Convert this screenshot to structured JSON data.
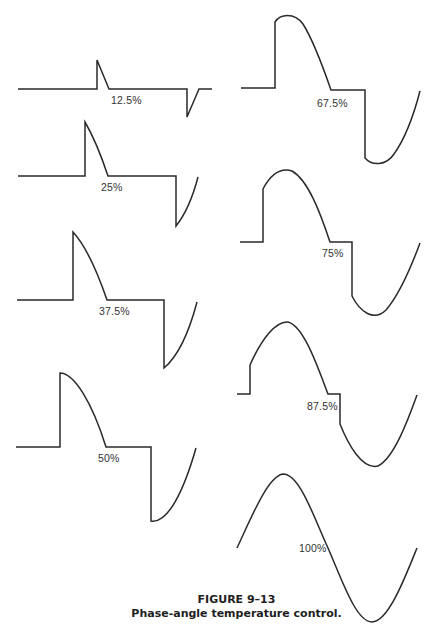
{
  "caption": {
    "figure_number": "FIGURE 9–13",
    "title": "Phase-angle temperature control."
  },
  "colors": {
    "stroke": "#2a2a2a",
    "background": "#ffffff",
    "text": "#333333"
  },
  "waveforms": [
    {
      "label": "12.5%",
      "label_pos": [
        111,
        94
      ],
      "path": "M18,89 L97,89 L97,60 L109,89 L187,89 L187,117 L199,89 L212,89"
    },
    {
      "label": "25%",
      "label_pos": [
        101,
        181
      ],
      "path": "M18,176 L85,176 L85,122 C92,134 100,152 108,176 L176,176 L176,226 C184,216 192,200 198,177"
    },
    {
      "label": "37.5%",
      "label_pos": [
        99,
        305
      ],
      "path": "M17,300 L73,300 L73,232 C84,244 96,268 107,300 L164,300 L164,368 C176,358 188,336 197,302"
    },
    {
      "label": "50%",
      "label_pos": [
        98,
        452
      ],
      "path": "M16,447 L60,447 L60,373 C74,373 92,402 106,447 L151,447 L151,521 C168,524 184,490 196,448"
    },
    {
      "label": "67.5%",
      "label_pos": [
        317,
        97
      ],
      "path": "M241,88 L275,88 L275,22 C280,14 294,12 303,24 C313,40 322,64 331,90 L365,90 L365,158 C372,166 386,166 394,154 C404,140 413,118 420,91"
    },
    {
      "label": "75%",
      "label_pos": [
        322,
        247
      ],
      "path": "M240,242 L263,242 L263,189 C272,172 282,168 292,171 C308,180 320,212 330,242 L352,242 L352,296 C360,312 374,322 386,310 C398,296 410,270 420,243"
    },
    {
      "label": "87.5%",
      "label_pos": [
        307,
        400
      ],
      "path": "M237,394 L250,394 L250,365 C262,338 276,321 288,322 C304,326 318,368 328,394 L340,394 L340,424 C348,444 362,470 378,466 C394,458 408,420 417,395"
    },
    {
      "label": "100%",
      "label_pos": [
        299,
        542
      ],
      "path": "M237,548 C252,516 268,476 283,474 C300,474 314,518 328,548 C342,580 356,622 372,622 C388,622 404,580 417,548"
    }
  ]
}
